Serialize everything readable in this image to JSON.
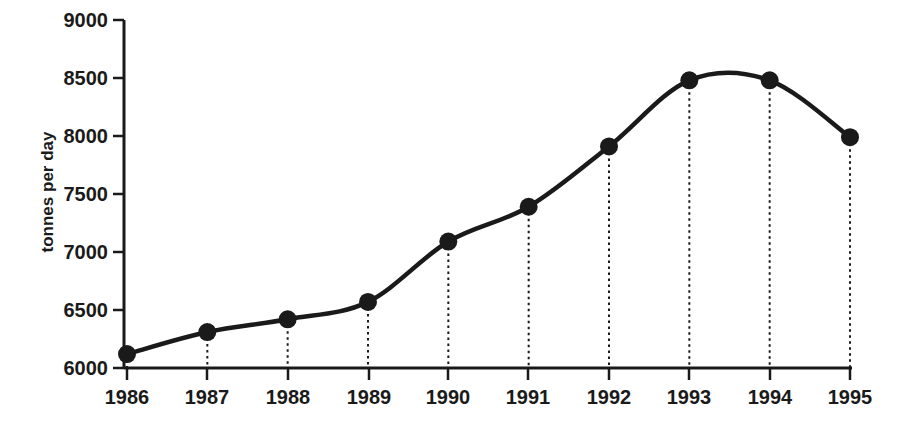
{
  "chart_data": {
    "type": "line",
    "title": "",
    "subtitle": "",
    "xlabel": "",
    "ylabel": "tonnes per day",
    "categories": [
      "1986",
      "1987",
      "1988",
      "1989",
      "1990",
      "1991",
      "1992",
      "1993",
      "1994",
      "1995"
    ],
    "x": [
      1986,
      1987,
      1988,
      1989,
      1990,
      1991,
      1992,
      1993,
      1994,
      1995
    ],
    "values": [
      6120,
      6310,
      6420,
      6570,
      7090,
      7390,
      7910,
      8480,
      8480,
      7990
    ],
    "series": [
      {
        "name": "tonnes per day",
        "values": [
          6120,
          6310,
          6420,
          6570,
          7090,
          7390,
          7910,
          8480,
          8480,
          7990
        ]
      }
    ],
    "ylim": [
      6000,
      9000
    ],
    "yticks": [
      6000,
      6500,
      7000,
      7500,
      8000,
      8500,
      9000
    ],
    "ytick_labels": [
      "6000",
      "6500",
      "7000",
      "7500",
      "8000",
      "8500",
      "9000"
    ],
    "xtick_labels": [
      "1986",
      "1987",
      "1988",
      "1989",
      "1990",
      "1991",
      "1992",
      "1993",
      "1994",
      "1995"
    ],
    "grid": false,
    "droplines": true,
    "legend": false,
    "legend_position": "none",
    "marker": "filled-circle",
    "line_color": "#1a1a1a",
    "marker_color": "#1a1a1a",
    "axis_color": "#1a1a1a",
    "background_color": "#ffffff",
    "annotations": []
  },
  "axes": {
    "y_title": "tonnes per day",
    "y_tick_values": [
      "6000",
      "6500",
      "7000",
      "7500",
      "8000",
      "8500",
      "9000"
    ],
    "x_tick_values": [
      "1986",
      "1987",
      "1988",
      "1989",
      "1990",
      "1991",
      "1992",
      "1993",
      "1994",
      "1995"
    ]
  }
}
